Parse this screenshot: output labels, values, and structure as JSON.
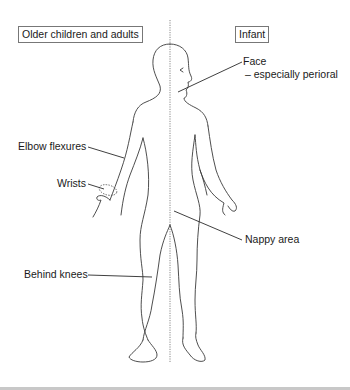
{
  "diagram": {
    "type": "anatomical-distribution",
    "headers": {
      "left": "Older children and adults",
      "right": "Infant"
    },
    "labels": {
      "face_line1": "Face",
      "face_line2": "– especially perioral",
      "elbow": "Elbow flexures",
      "wrists": "Wrists",
      "nappy": "Nappy area",
      "knees": "Behind knees"
    },
    "colors": {
      "outline": "#3a3a3a",
      "divider": "#888888",
      "box_border": "#777777",
      "bottom_bar": "#c8c8c8"
    }
  }
}
